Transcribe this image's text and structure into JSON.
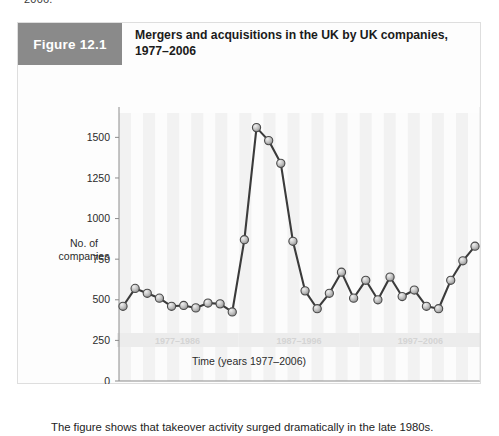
{
  "page": {
    "top_fragment": "2006."
  },
  "figure": {
    "badge": "Figure 12.1",
    "title": "Mergers and acquisitions in the UK by UK companies, 1977–2006",
    "caption": "The figure shows that takeover activity surged dramatically in the late 1980s."
  },
  "colors": {
    "badge_bg": "#8a8a8a",
    "line": "#3b3b3b",
    "marker_fill": "#b9b9b9",
    "band": "#ececec",
    "axis": "#8c8c8c",
    "plot_bg": "#fcfcfc"
  },
  "chart_data": {
    "type": "line",
    "title": "Mergers and acquisitions in the UK by UK companies, 1977–2006",
    "xlabel": "Time (years 1977–2006)",
    "ylabel": "No. of companies",
    "ylim": [
      0,
      1650
    ],
    "yticks": [
      0,
      250,
      500,
      750,
      1000,
      1250,
      1500
    ],
    "ytick_labels": [
      "0",
      "250",
      "500",
      "750",
      "1000",
      "1250",
      "1500"
    ],
    "grid": false,
    "legend": null,
    "x": [
      1977,
      1978,
      1979,
      1980,
      1981,
      1982,
      1983,
      1984,
      1985,
      1986,
      1987,
      1988,
      1989,
      1990,
      1991,
      1992,
      1993,
      1994,
      1995,
      1996,
      1997,
      1998,
      1999,
      2000,
      2001,
      2002,
      2003,
      2004,
      2005,
      2006
    ],
    "x_tick_labels": [],
    "series": [
      {
        "name": "No. of companies",
        "values": [
          460,
          570,
          540,
          510,
          460,
          465,
          450,
          480,
          475,
          425,
          870,
          1560,
          1480,
          1340,
          860,
          555,
          445,
          540,
          670,
          510,
          620,
          500,
          640,
          520,
          560,
          460,
          445,
          620,
          740,
          830
        ]
      }
    ],
    "bands": [
      {
        "label": "1977–1986",
        "start": 1977,
        "end": 1986
      },
      {
        "label": "1987–1996",
        "start": 1987,
        "end": 1996
      },
      {
        "label": "1997–2006",
        "start": 1997,
        "end": 2006
      }
    ]
  }
}
